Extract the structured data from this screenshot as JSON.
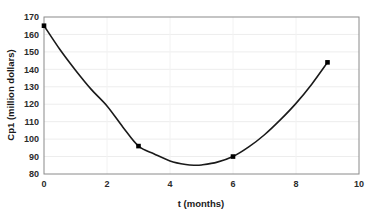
{
  "chart_data": {
    "type": "line",
    "title": "",
    "xlabel": "t (months)",
    "ylabel": "Cp1 (million dollars)",
    "xlim": [
      0,
      10
    ],
    "ylim": [
      80,
      170
    ],
    "xticks": [
      0,
      2,
      4,
      6,
      8,
      10
    ],
    "yticks": [
      80,
      90,
      100,
      110,
      120,
      130,
      140,
      150,
      160,
      170
    ],
    "grid": true,
    "legend": "none",
    "series": [
      {
        "name": "Cp1",
        "marker": "square",
        "marker_color": "#000000",
        "line_color": "#1a1a1a",
        "x": [
          0,
          3,
          6,
          9
        ],
        "values": [
          165,
          96,
          90,
          144
        ]
      }
    ],
    "fit_curve": {
      "description": "smooth quadratic-like curve through the plotted points",
      "vertex_x": 4.8,
      "vertex_y": 85,
      "x": [
        0,
        0.5,
        1,
        1.5,
        2,
        2.5,
        3,
        3.5,
        4,
        4.5,
        4.8,
        5,
        5.5,
        6,
        6.5,
        7,
        7.5,
        8,
        8.5,
        9
      ],
      "y": [
        165,
        151.5,
        139.5,
        128.5,
        119,
        107,
        96,
        91.5,
        87.5,
        85.4,
        85,
        85.2,
        86.8,
        90,
        95.5,
        102.5,
        111,
        120.5,
        131.5,
        144
      ]
    }
  },
  "axes": {
    "x_tick_labels": [
      "0",
      "2",
      "4",
      "6",
      "8",
      "10"
    ],
    "y_tick_labels": [
      "80",
      "90",
      "100",
      "110",
      "120",
      "130",
      "140",
      "150",
      "160",
      "170"
    ],
    "x_axis_title": "t (months)",
    "y_axis_title": "Cp1 (million dollars)"
  },
  "style": {
    "plot_background": "#ffffff",
    "border_color": "#808080",
    "gridline_color": "#ededed",
    "line_color": "#1a1a1a",
    "marker_color": "#000000",
    "text_color": "#2b2b2b"
  }
}
